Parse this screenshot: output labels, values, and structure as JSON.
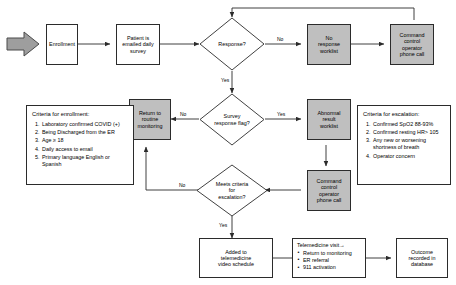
{
  "diagram": {
    "colors": {
      "shaded_fill": "#bfbfbf",
      "plain_fill": "#ffffff",
      "stroke": "#2b2b2b",
      "start_arrow_fill": "#9e9e9e"
    },
    "nodes": {
      "start_arrow": "start-arrow",
      "enrollment": "Enrollment",
      "emailed_survey": "Patient is\nemailed daily\nsurvey",
      "response_decision": "Response?",
      "no_response_worklist": "No\nresponse\nworklist",
      "command_control_top": "Command\ncontrol\noperator\nphone call",
      "survey_flag_decision": "Survey\nresponse flag?",
      "abnormal_result_worklist": "Abnormal\nresult\nworklist",
      "return_routine_monitoring": "Return to\nroutine\nmonitoring",
      "command_control_mid": "Command\ncontrol\noperator\nphone call",
      "escalation_decision": "Meets criteria\nfor\nescalation?",
      "telemedicine_schedule": "Added to\ntelemedicine\nvideo schedule",
      "outcome_recorded": "Outcome\nrecorded in\ndatabase"
    },
    "telemedicine_visit": {
      "title": "Telemedicine visit→",
      "items": [
        "Return to monitoring",
        "ER referral",
        "911 activation"
      ]
    },
    "enrollment_criteria": {
      "title": "Criteria for enrollment:",
      "items": [
        "Laboratory confirmed COVID (+)",
        "Being Discharged from the ER",
        "Age ≥ 18",
        "Daily access to email",
        "Primary language English or Spanish"
      ]
    },
    "escalation_criteria": {
      "title": "Criteria for escalation:",
      "items": [
        "Confirmed SpO2 88-93%",
        "Confirmed resting HR> 105",
        "Any new or worsening shortness of breath",
        "Operator concern"
      ]
    },
    "edge_labels": {
      "response_no": "No",
      "response_yes": "Yes",
      "flag_yes": "Yes",
      "flag_no": "No",
      "escalation_no": "No",
      "escalation_yes": "Yes"
    }
  }
}
